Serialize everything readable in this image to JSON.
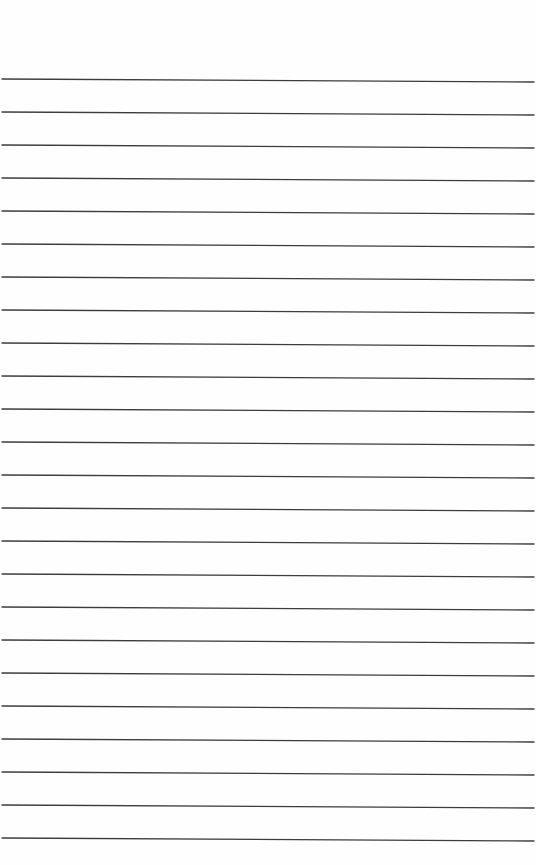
{
  "page": {
    "kind": "ruled-lined-paper",
    "background_color": "#fefefe",
    "line_color": "#3c3c3c",
    "line_count": 24,
    "line_spacing_px": 33,
    "first_line_y_left": 79,
    "last_line_y_left": 838,
    "right_edge_drop_px": 3,
    "text": []
  }
}
